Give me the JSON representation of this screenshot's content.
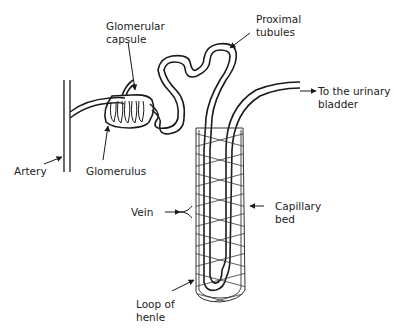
{
  "diagram": {
    "type": "Nephron structure",
    "colors": {
      "stroke": "#1a1a1a",
      "background": "#ffffff",
      "text": "#222222"
    },
    "labels": {
      "glomerular_capsule": [
        "Glomerular",
        "capsule"
      ],
      "proximal_tubules": [
        "Proximal",
        "tubules"
      ],
      "to_bladder": [
        "To the urinary",
        "bladder"
      ],
      "artery": "Artery",
      "glomerulus": "Glomerulus",
      "vein": "Vein",
      "capillary_bed": [
        "Capillary",
        "bed"
      ],
      "loop_of_henle": [
        "Loop of",
        "henle"
      ]
    }
  }
}
